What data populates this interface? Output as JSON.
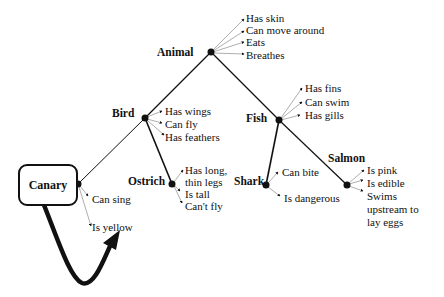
{
  "nodes": {
    "animal": {
      "label": "Animal",
      "properties": [
        "Has skin",
        "Can move around",
        "Eats",
        "Breathes"
      ]
    },
    "bird": {
      "label": "Bird",
      "properties": [
        "Has wings",
        "Can fly",
        "Has feathers"
      ]
    },
    "fish": {
      "label": "Fish",
      "properties": [
        "Has fins",
        "Can swim",
        "Has gills"
      ]
    },
    "canary": {
      "label": "Canary",
      "properties": [
        "Can sing",
        "Is yellow"
      ]
    },
    "ostrich": {
      "label": "Ostrich",
      "properties": [
        "Has long,",
        "thin legs",
        "Is tall",
        "Can't fly"
      ]
    },
    "shark": {
      "label": "Shark",
      "properties": [
        "Can bite",
        "Is dangerous"
      ]
    },
    "salmon": {
      "label": "Salmon",
      "properties": [
        "Is pink",
        "Is edible",
        "Swims",
        "upstream to",
        "lay eggs"
      ]
    }
  },
  "edges": [
    [
      "animal",
      "bird"
    ],
    [
      "animal",
      "fish"
    ],
    [
      "bird",
      "canary"
    ],
    [
      "bird",
      "ostrich"
    ],
    [
      "fish",
      "shark"
    ],
    [
      "fish",
      "salmon"
    ]
  ],
  "colors": {
    "ink": "#111111",
    "background": "#ffffff"
  }
}
